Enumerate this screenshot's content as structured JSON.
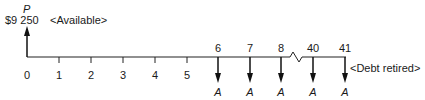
{
  "diagram": {
    "type": "cash-flow-timeline",
    "present_value": {
      "symbol": "P",
      "amount": "$9 250",
      "note": "<Available>",
      "period": 0,
      "direction": "up"
    },
    "axis": {
      "ticks": [
        {
          "label": "0",
          "x": 27
        },
        {
          "label": "1",
          "x": 59
        },
        {
          "label": "2",
          "x": 91
        },
        {
          "label": "3",
          "x": 123
        },
        {
          "label": "4",
          "x": 155
        },
        {
          "label": "5",
          "x": 187
        }
      ],
      "break_between": [
        "8",
        "40"
      ],
      "end_note": "<Debt retired>"
    },
    "payments": [
      {
        "period": "6",
        "symbol": "A",
        "x": 218
      },
      {
        "period": "7",
        "symbol": "A",
        "x": 250
      },
      {
        "period": "8",
        "symbol": "A",
        "x": 281
      },
      {
        "period": "40",
        "symbol": "A",
        "x": 313
      },
      {
        "period": "41",
        "symbol": "A",
        "x": 345
      }
    ]
  }
}
